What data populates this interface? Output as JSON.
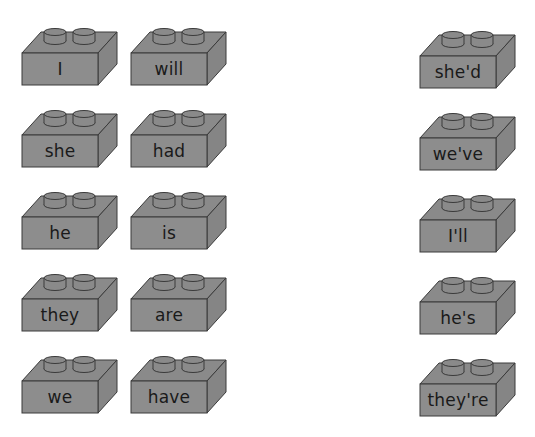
{
  "worksheet": {
    "left_words": [
      [
        "I",
        "will"
      ],
      [
        "she",
        "had"
      ],
      [
        "he",
        "is"
      ],
      [
        "they",
        "are"
      ],
      [
        "we",
        "have"
      ]
    ],
    "contractions": [
      "she'd",
      "we've",
      "I'll",
      "he's",
      "they're"
    ]
  },
  "colors": {
    "brick_face": "#8d8d8d",
    "brick_top": "#8a8a8a",
    "brick_side": "#858585",
    "outline": "#3a3a3a",
    "text": "#1a1a1a"
  }
}
